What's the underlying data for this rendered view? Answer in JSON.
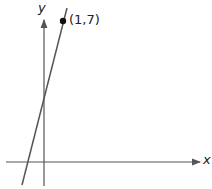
{
  "diagram": {
    "type": "coordinate-plane-line",
    "x_axis_label": "x",
    "y_axis_label": "y",
    "point_label": "(1,7)",
    "point": {
      "x": 1,
      "y": 7
    },
    "colors": {
      "axis": "#555555",
      "line": "#555555",
      "point": "#111111"
    }
  }
}
